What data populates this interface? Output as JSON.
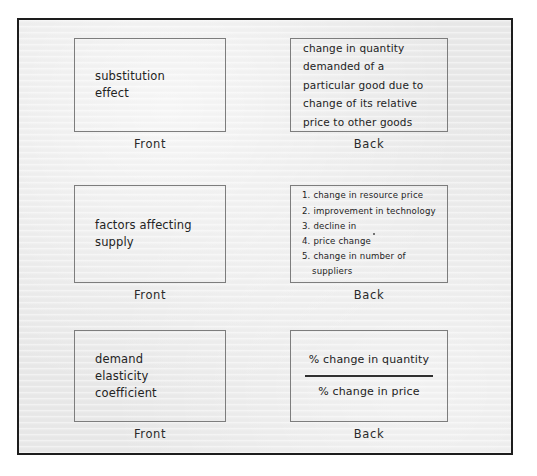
{
  "document": {
    "kind": "flashcard-sheet",
    "frame_border_color": "#1d1d1d",
    "background_color": "#e9e9e9",
    "card_border_color": "#7d7d7d",
    "ink_color": "#232323",
    "front_label": "Front",
    "back_label": "Back"
  },
  "cards": [
    {
      "front_label": "Front",
      "back_label": "Back",
      "front_lines": [
        "substitution",
        "effect"
      ],
      "back_lines": [
        "change in quantity",
        "demanded of a",
        "particular good due to",
        "change of its relative",
        "price to other goods"
      ]
    },
    {
      "front_label": "Front",
      "back_label": "Back",
      "front_lines": [
        "factors affecting",
        "supply"
      ],
      "back_list": [
        "1. change in resource price",
        "2. improvement in technology",
        "3. decline in",
        "4. price change",
        "5. change in number of"
      ],
      "back_list_continuation": "suppliers"
    },
    {
      "front_label": "Front",
      "back_label": "Back",
      "front_lines": [
        "demand",
        "elasticity",
        "coefficient"
      ],
      "back_fraction": {
        "numerator": "% change in quantity",
        "denominator": "% change in price"
      }
    }
  ]
}
